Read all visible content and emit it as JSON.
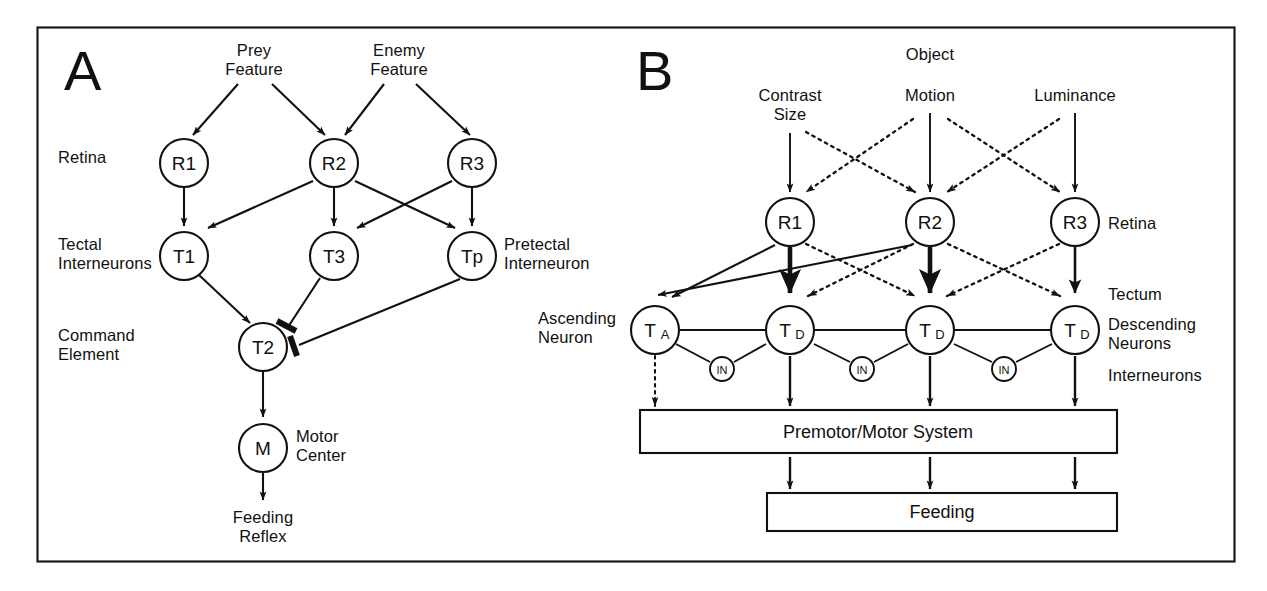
{
  "figure": {
    "border_color": "#1a1a1a",
    "stroke_color": "#111111",
    "background": "#ffffff"
  },
  "panel_a": {
    "letter": "A",
    "row_labels": {
      "retina": "Retina",
      "tectal_interneurons_line1": "Tectal",
      "tectal_interneurons_line2": "Interneurons",
      "command_line1": "Command",
      "command_line2": "Element"
    },
    "inputs": [
      {
        "id": "prey",
        "line1": "Prey",
        "line2": "Feature"
      },
      {
        "id": "enemy",
        "line1": "Enemy",
        "line2": "Feature"
      }
    ],
    "nodes": [
      {
        "id": "R1",
        "label": "R1",
        "sub": ""
      },
      {
        "id": "R2",
        "label": "R2",
        "sub": ""
      },
      {
        "id": "R3",
        "label": "R3",
        "sub": ""
      },
      {
        "id": "T1",
        "label": "T1",
        "sub": ""
      },
      {
        "id": "T3",
        "label": "T3",
        "sub": ""
      },
      {
        "id": "Tp",
        "label": "Tp",
        "sub": ""
      },
      {
        "id": "T2",
        "label": "T2",
        "sub": ""
      },
      {
        "id": "M",
        "label": "M",
        "sub": ""
      }
    ],
    "side_labels": {
      "pretectal_line1": "Pretectal",
      "pretectal_line2": "Interneuron",
      "motor_line1": "Motor",
      "motor_line2": "Center"
    },
    "output": {
      "line1": "Feeding",
      "line2": "Reflex"
    }
  },
  "panel_b": {
    "letter": "B",
    "object_label": "Object",
    "inputs": [
      {
        "id": "contrast",
        "line1": "Contrast",
        "line2": "Size"
      },
      {
        "id": "motion",
        "line1": "Motion",
        "line2": ""
      },
      {
        "id": "luminance",
        "line1": "Luminance",
        "line2": ""
      }
    ],
    "retina_nodes": [
      {
        "id": "R1",
        "label": "R1",
        "sub": ""
      },
      {
        "id": "R2",
        "label": "R2",
        "sub": ""
      },
      {
        "id": "R3",
        "label": "R3",
        "sub": ""
      }
    ],
    "tectum_nodes": [
      {
        "id": "TA",
        "label": "T",
        "sub": "A"
      },
      {
        "id": "TD1",
        "label": "T",
        "sub": "D"
      },
      {
        "id": "TD2",
        "label": "T",
        "sub": "D"
      },
      {
        "id": "TD3",
        "label": "T",
        "sub": "D"
      }
    ],
    "interneurons": [
      {
        "id": "IN1",
        "label": "IN"
      },
      {
        "id": "IN2",
        "label": "IN"
      },
      {
        "id": "IN3",
        "label": "IN"
      }
    ],
    "left_labels": {
      "ascending_line1": "Ascending",
      "ascending_line2": "Neuron"
    },
    "right_labels": {
      "retina": "Retina",
      "tectum": "Tectum",
      "descending_line1": "Descending",
      "descending_line2": "Neurons",
      "interneurons": "Interneurons"
    },
    "boxes": [
      {
        "id": "premotor",
        "label": "Premotor/Motor System"
      },
      {
        "id": "feeding",
        "label": "Feeding"
      }
    ]
  }
}
